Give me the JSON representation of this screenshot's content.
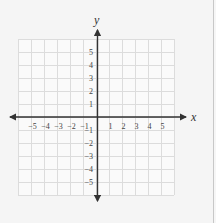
{
  "diagram": {
    "type": "coordinate-plane",
    "x_axis_label": "x",
    "y_axis_label": "y",
    "grid_range": {
      "x": [
        -6,
        6
      ],
      "y": [
        -6,
        6
      ]
    },
    "x_tick_labels": [
      "−5",
      "−4",
      "−3",
      "−2",
      "−1",
      "1",
      "2",
      "3",
      "4",
      "5"
    ],
    "y_tick_labels": [
      "5",
      "4",
      "3",
      "2",
      "1",
      "−1",
      "−2",
      "−3",
      "−4",
      "−5"
    ],
    "colors": {
      "background": "#f5f5f5",
      "grid": "#dcdcdc",
      "axis": "#333333",
      "border": "#c8c8c8"
    }
  }
}
